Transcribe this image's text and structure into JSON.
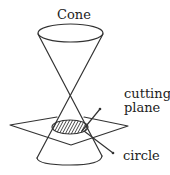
{
  "figure": {
    "labels": {
      "cone": "Cone",
      "cutting_plane_line1": "cutting",
      "cutting_plane_line2": "plane",
      "circle": "circle"
    },
    "colors": {
      "line": "#333333",
      "text": "#222222",
      "background": "#ffffff"
    }
  }
}
